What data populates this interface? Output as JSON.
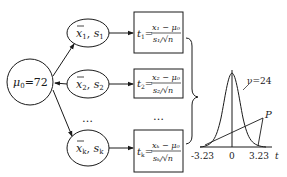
{
  "population": {
    "label_mu": "μ",
    "label_sub": "0",
    "label_val": "=72"
  },
  "samples": [
    {
      "xbar": "x",
      "sub": "1",
      "s": "s",
      "ssub": "1"
    },
    {
      "xbar": "x",
      "sub": "2",
      "s": "s",
      "ssub": "2"
    },
    {
      "xbar": "x",
      "sub": "k",
      "s": "s",
      "ssub": "k"
    }
  ],
  "ellipsis": "…",
  "formulas": [
    {
      "t": "t",
      "sub": "1",
      "num": "x₁ − μ₀",
      "den": "s₁/√n"
    },
    {
      "t": "t",
      "sub": "2",
      "num": "x₂ − μ₀",
      "den": "s₂/√n"
    },
    {
      "t": "t",
      "sub": "k",
      "num": "xₖ − μ₀",
      "den": "sₖ/√n"
    }
  ],
  "distribution": {
    "df_label": "ν=24",
    "point_label": "P",
    "axis_label": "t",
    "ticks": [
      "-3.23",
      "0",
      "3.23"
    ]
  }
}
